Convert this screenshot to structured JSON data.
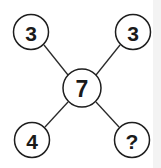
{
  "diagram": {
    "type": "number-puzzle-cross",
    "center": {
      "label": "7",
      "x": 82,
      "y": 88,
      "r": 19
    },
    "nodes": [
      {
        "id": "top-left",
        "label": "3",
        "x": 31,
        "y": 32,
        "r": 17.5
      },
      {
        "id": "top-right",
        "label": "3",
        "x": 133,
        "y": 32,
        "r": 17.5
      },
      {
        "id": "bottom-left",
        "label": "4",
        "x": 32,
        "y": 140,
        "r": 17.5
      },
      {
        "id": "bottom-right",
        "label": "?",
        "x": 132,
        "y": 140,
        "r": 17.5
      }
    ],
    "colors": {
      "stroke": "#1e1e1e",
      "text": "#1a1a1a",
      "background": "#ffffff"
    }
  }
}
